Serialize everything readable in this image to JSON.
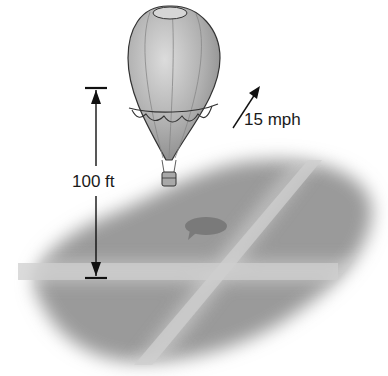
{
  "diagram": {
    "height_label": "100 ft",
    "wind_speed_label": "15 mph",
    "colors": {
      "ground": "#9a9a9a",
      "road": "#c8c8c8",
      "balloon_body": "#b8b8b8",
      "shadow": "#7a7a7a",
      "ink": "#111111"
    }
  }
}
